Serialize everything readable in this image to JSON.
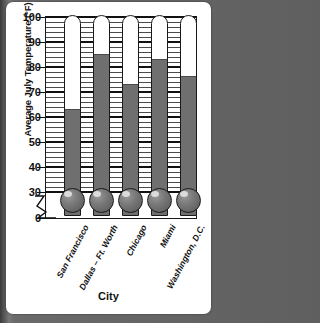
{
  "chart_data": {
    "type": "bar",
    "title": "",
    "ylabel": "Average July Temperature (°F)",
    "xlabel": "City",
    "categories": [
      "San Francisco",
      "Dallas – Ft. Worth",
      "Chicago",
      "Miami",
      "Washington, D.C."
    ],
    "values": [
      63,
      85,
      73,
      83,
      76
    ],
    "ylim": [
      0,
      100
    ],
    "y_ticks": [
      "0",
      "30",
      "40",
      "50",
      "60",
      "70",
      "80",
      "90",
      "100"
    ],
    "y_tick_values": [
      0,
      30,
      40,
      50,
      60,
      70,
      80,
      90,
      100
    ],
    "axis_break": true,
    "axis_break_between": [
      0,
      30
    ],
    "grid": true,
    "grid_minor_step": 2,
    "legend": "none",
    "style": "thermometer-bars",
    "series": [
      {
        "name": "Average July Temperature",
        "values": [
          63,
          85,
          73,
          83,
          76
        ]
      }
    ],
    "colors": {
      "bar_fill": "#6f6f6f",
      "tube_background": "#ffffff",
      "outline": "#1a1a1a",
      "grid": "#2b2b2b",
      "page": "#ffffff",
      "backdrop": "#5f5f5f"
    }
  }
}
